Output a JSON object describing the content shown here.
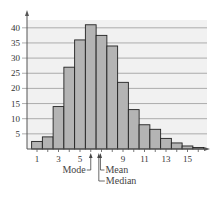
{
  "chart_data": {
    "type": "bar",
    "title": "",
    "xlabel": "",
    "ylabel": "",
    "categories": [
      1,
      2,
      3,
      4,
      5,
      6,
      7,
      8,
      9,
      10,
      11,
      12,
      13,
      14,
      15,
      16
    ],
    "values": [
      2.5,
      4,
      14,
      27,
      36,
      41,
      37.5,
      34,
      22,
      13,
      8,
      6.5,
      3.5,
      2,
      1,
      0.5
    ],
    "x_tick_labels": [
      "1",
      "3",
      "5",
      "9",
      "11",
      "13",
      "15"
    ],
    "y_ticks": [
      5,
      10,
      15,
      20,
      25,
      30,
      35,
      40
    ],
    "ylim": [
      0,
      43
    ],
    "grid": true,
    "annotations": [
      {
        "label": "Mode",
        "x": 6
      },
      {
        "label": "Mean",
        "x": 6.9
      },
      {
        "label": "Median",
        "x": 6.75
      }
    ],
    "colors": {
      "bar_fill": "#b4b4b4",
      "bar_stroke": "#222222",
      "plot_bg": "#f1f1f1",
      "grid": "#9a9a9a"
    }
  }
}
